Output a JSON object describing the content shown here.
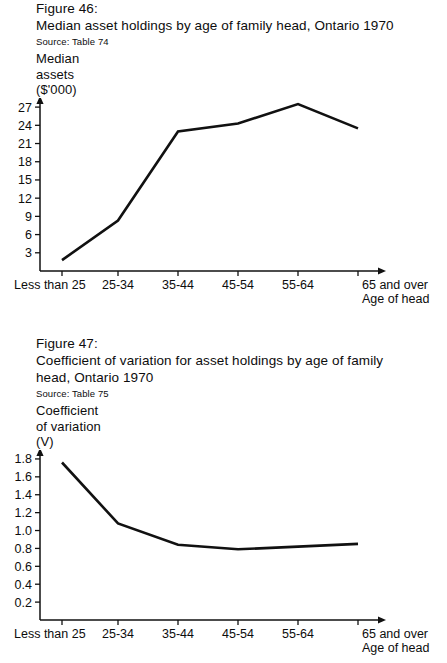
{
  "page": {
    "background": "#ffffff",
    "ink": "#111111"
  },
  "figures": [
    {
      "id": "figure-46",
      "number": "Figure 46:",
      "title_line1": "Median asset holdings by age of family head, Ontario 1970",
      "title_line2": "",
      "source": "Source: Table 74",
      "axis_caption_line1": "Median",
      "axis_caption_line2": "assets",
      "axis_caption_line3": "($'000)",
      "xaxis_title": "Age of head"
    },
    {
      "id": "figure-47",
      "number": "Figure 47:",
      "title_line1": "Coefficient of variation for asset holdings by age of family",
      "title_line2": "head, Ontario 1970",
      "source": "Source: Table 75",
      "axis_caption_line1": "Coefficient",
      "axis_caption_line2": "of variation",
      "axis_caption_line3": "(V)",
      "xaxis_title": "Age of head"
    }
  ],
  "chart_data": [
    {
      "type": "line",
      "title": "Median asset holdings by age of family head, Ontario 1970",
      "subtitle": "Figure 46:",
      "source": "Source: Table 74",
      "xlabel": "Age of head",
      "ylabel": "Median assets ($'000)",
      "categories": [
        "Less than 25",
        "25-34",
        "35-44",
        "45-54",
        "55-64",
        "65 and over"
      ],
      "values": [
        1.8,
        8.3,
        23.0,
        24.3,
        27.5,
        23.5
      ],
      "yticks": [
        3,
        6,
        9,
        12,
        15,
        18,
        21,
        24,
        27
      ],
      "ytick_labels": [
        "3",
        "6",
        "9",
        "12",
        "15",
        "18",
        "21",
        "24",
        "27"
      ],
      "ylim": [
        0,
        28.5
      ],
      "grid": false,
      "legend": "none"
    },
    {
      "type": "line",
      "title": "Coefficient of variation for asset holdings by age of family head, Ontario 1970",
      "subtitle": "Figure 47:",
      "source": "Source: Table 75",
      "xlabel": "Age of head",
      "ylabel": "Coefficient of variation (V)",
      "categories": [
        "Less than 25",
        "25-34",
        "35-44",
        "45-54",
        "55-64",
        "65 and over"
      ],
      "values": [
        1.76,
        1.08,
        0.84,
        0.79,
        0.82,
        0.85
      ],
      "yticks": [
        0.2,
        0.4,
        0.6,
        0.8,
        1.0,
        1.2,
        1.4,
        1.6,
        1.8
      ],
      "ytick_labels": [
        "0.2",
        "0.4",
        "0.6",
        "0.8",
        "1.0",
        "1.2",
        "1.4",
        "1.6",
        "1.8"
      ],
      "ylim": [
        0,
        1.9
      ],
      "grid": false,
      "legend": "none"
    }
  ]
}
